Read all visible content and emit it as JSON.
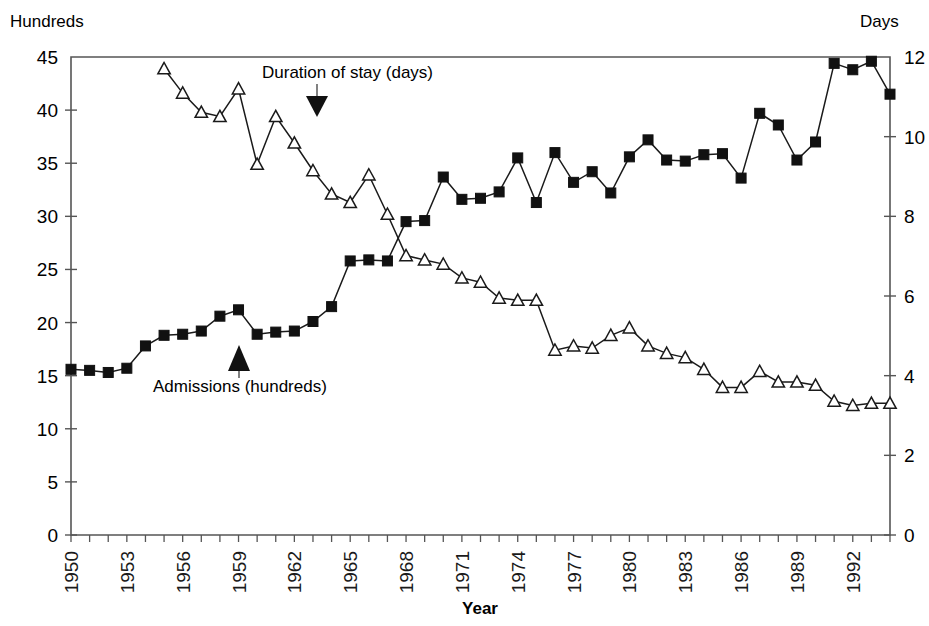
{
  "chart_data": {
    "type": "line",
    "title": "",
    "xlabel": "Year",
    "left_axis": {
      "label": "Hundreds",
      "min": 0,
      "max": 45,
      "step": 5,
      "ticks": [
        "0",
        "5",
        "10",
        "15",
        "20",
        "25",
        "30",
        "35",
        "40",
        "45"
      ]
    },
    "right_axis": {
      "label": "Days",
      "min": 0,
      "max": 12,
      "step": 2,
      "ticks": [
        "0",
        "2",
        "4",
        "6",
        "8",
        "10",
        "12"
      ]
    },
    "x": [
      1950,
      1951,
      1952,
      1953,
      1954,
      1955,
      1956,
      1957,
      1958,
      1959,
      1960,
      1961,
      1962,
      1963,
      1964,
      1965,
      1966,
      1967,
      1968,
      1969,
      1970,
      1971,
      1972,
      1973,
      1974,
      1975,
      1976,
      1977,
      1978,
      1979,
      1980,
      1981,
      1982,
      1983,
      1984,
      1985,
      1986,
      1987,
      1988,
      1989,
      1990,
      1991,
      1992,
      1993,
      1994
    ],
    "xtick_labels": [
      "1950",
      "1953",
      "1956",
      "1959",
      "1962",
      "1965",
      "1968",
      "1971",
      "1974",
      "1977",
      "1980",
      "1983",
      "1986",
      "1989",
      "1992"
    ],
    "xtick_years": [
      1950,
      1953,
      1956,
      1959,
      1962,
      1965,
      1968,
      1971,
      1974,
      1977,
      1980,
      1983,
      1986,
      1989,
      1992
    ],
    "grid": false,
    "legend_position": "inline-annotations",
    "series": [
      {
        "name": "Admissions (hundreds)",
        "axis": "left",
        "marker": "filled-square",
        "label_annotation": "Admissions (hundreds)",
        "annotation_arrow": "up-triangle",
        "values": [
          15.6,
          15.5,
          15.3,
          15.7,
          17.8,
          18.8,
          18.9,
          19.2,
          20.6,
          21.2,
          18.9,
          19.1,
          19.2,
          20.1,
          21.5,
          25.8,
          25.9,
          25.8,
          29.5,
          29.6,
          33.7,
          31.6,
          31.7,
          32.3,
          35.5,
          31.3,
          36.0,
          33.2,
          34.2,
          32.2,
          35.6,
          37.2,
          35.3,
          35.2,
          35.8,
          35.9,
          33.6,
          39.7,
          38.6,
          35.3,
          37.0,
          44.4,
          43.8,
          44.6,
          41.5
        ]
      },
      {
        "name": "Duration of stay (days)",
        "axis": "right",
        "marker": "open-triangle",
        "label_annotation": "Duration of stay (days)",
        "annotation_arrow": "down-triangle",
        "values_days": [
          null,
          null,
          null,
          null,
          null,
          11.7,
          11.1,
          10.6,
          10.5,
          11.2,
          9.3,
          10.5,
          9.85,
          9.15,
          8.55,
          8.35,
          9.05,
          8.05,
          7.0,
          6.9,
          6.8,
          6.45,
          6.35,
          5.95,
          5.9,
          5.9,
          4.65,
          4.75,
          4.7,
          5.0,
          5.2,
          4.75,
          4.55,
          4.45,
          4.15,
          3.7,
          3.7,
          4.1,
          3.85,
          3.85,
          3.75,
          3.35,
          3.25,
          3.3,
          3.3
        ],
        "values_hundreds_scale": [
          null,
          null,
          null,
          null,
          null,
          43.9,
          41.6,
          39.8,
          39.4,
          42.0,
          34.9,
          39.4,
          36.9,
          34.3,
          32.1,
          31.3,
          33.9,
          30.2,
          26.3,
          25.9,
          25.5,
          24.2,
          23.8,
          22.3,
          22.1,
          22.1,
          17.4,
          17.8,
          17.6,
          18.8,
          19.5,
          17.8,
          17.1,
          16.7,
          15.6,
          13.9,
          13.9,
          15.4,
          14.4,
          14.4,
          14.1,
          12.6,
          12.2,
          12.4,
          12.4
        ]
      }
    ],
    "annotations": [
      {
        "text": "Duration of stay (days)",
        "x_year": 1963,
        "kind": "series-label-top"
      },
      {
        "text": "Admissions (hundreds)",
        "x_year": 1959,
        "kind": "series-label-bottom"
      }
    ]
  },
  "labels": {
    "unit_left": "Hundreds",
    "unit_right": "Days",
    "x_axis_title": "Year",
    "duration_label": "Duration of stay (days)",
    "admissions_label": "Admissions (hundreds)"
  },
  "colors": {
    "line": "#1a1a1a",
    "axis": "#555555",
    "marker_fill": "#111111",
    "background": "#ffffff"
  }
}
